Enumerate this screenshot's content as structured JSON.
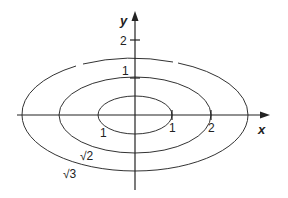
{
  "diagram": {
    "type": "level curves (concentric ellipses)",
    "axes": {
      "x_label": "x",
      "y_label": "y",
      "x_ticks": [
        {
          "value": 1,
          "label": "1"
        },
        {
          "value": 2,
          "label": "2"
        }
      ],
      "y_ticks": [
        {
          "value": 1,
          "label": "1"
        },
        {
          "value": 2,
          "label": "2"
        }
      ]
    },
    "curves": [
      {
        "level_label": "1",
        "x_intercept": 1,
        "y_intercept": 0.5
      },
      {
        "level_label": "√2",
        "x_intercept": 2,
        "y_intercept": 1
      },
      {
        "level_label": "√3",
        "x_intercept": 3,
        "y_intercept": 1.5
      }
    ],
    "labels": {
      "x_tick_1": "1",
      "x_tick_2": "2",
      "y_tick_1": "1",
      "y_tick_2": "2",
      "curve_inner": "1",
      "curve_middle": "√2",
      "curve_outer": "√3",
      "x_axis": "x",
      "y_axis": "y"
    },
    "colors": {
      "line": "#333333",
      "background": "#ffffff"
    }
  }
}
